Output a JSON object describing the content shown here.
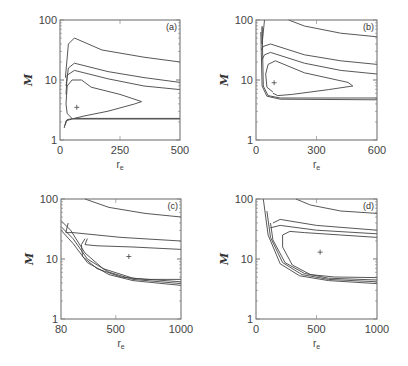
{
  "chart_data": [
    {
      "type": "contour",
      "panel": "(a)",
      "title": "",
      "xlabel": "r_e",
      "ylabel": "M",
      "xscale": "linear",
      "yscale": "log",
      "xlim": [
        0,
        500
      ],
      "ylim": [
        1,
        100
      ],
      "xticks": [
        "0",
        "250",
        "500"
      ],
      "yticks": [
        "1",
        "10",
        "100"
      ],
      "marker": {
        "symbol": "+",
        "x": 70,
        "y": 3.5
      },
      "box": {
        "left": 60,
        "top": 20,
        "right": 180,
        "bottom": 140
      },
      "contours": [
        [
          [
            0.1,
            0.82
          ],
          [
            0.06,
            0.78
          ],
          [
            0.05,
            0.7
          ],
          [
            0.06,
            0.55
          ],
          [
            0.1,
            0.5
          ],
          [
            0.18,
            0.5
          ],
          [
            0.26,
            0.56
          ],
          [
            0.5,
            0.62
          ],
          [
            0.68,
            0.68
          ],
          [
            0.62,
            0.7
          ],
          [
            0.4,
            0.76
          ],
          [
            0.2,
            0.8
          ],
          [
            0.12,
            0.82
          ]
        ],
        [
          [
            0.04,
            0.88
          ],
          [
            0.06,
            0.83
          ],
          [
            0.12,
            0.82
          ],
          [
            1.0,
            0.82
          ]
        ],
        [
          [
            0.035,
            0.9
          ],
          [
            0.05,
            0.84
          ],
          [
            0.1,
            0.825
          ],
          [
            1.0,
            0.825
          ]
        ],
        [
          [
            0.05,
            0.62
          ],
          [
            0.06,
            0.46
          ],
          [
            0.12,
            0.42
          ],
          [
            0.4,
            0.49
          ],
          [
            0.7,
            0.55
          ],
          [
            1.0,
            0.58
          ]
        ],
        [
          [
            0.05,
            0.55
          ],
          [
            0.07,
            0.4
          ],
          [
            0.12,
            0.36
          ],
          [
            0.4,
            0.43
          ],
          [
            0.7,
            0.48
          ],
          [
            1.0,
            0.52
          ]
        ],
        [
          [
            0.045,
            0.48
          ],
          [
            0.07,
            0.2
          ],
          [
            0.12,
            0.15
          ],
          [
            0.35,
            0.25
          ],
          [
            0.7,
            0.31
          ],
          [
            1.0,
            0.35
          ]
        ]
      ]
    },
    {
      "type": "contour",
      "panel": "(b)",
      "xlabel": "r_e",
      "ylabel": "M",
      "xscale": "linear",
      "yscale": "log",
      "xlim": [
        0,
        600
      ],
      "ylim": [
        1,
        100
      ],
      "xticks": [
        "0",
        "300",
        "600"
      ],
      "yticks": [
        "1",
        "10",
        "100"
      ],
      "marker": {
        "symbol": "+",
        "x": 90,
        "y": 9
      },
      "box": {
        "left": 256,
        "top": 20,
        "right": 377,
        "bottom": 140
      },
      "contours": [
        [
          [
            0.14,
            0.6
          ],
          [
            0.09,
            0.56
          ],
          [
            0.08,
            0.45
          ],
          [
            0.1,
            0.37
          ],
          [
            0.16,
            0.34
          ],
          [
            0.4,
            0.44
          ],
          [
            0.76,
            0.52
          ],
          [
            0.8,
            0.55
          ],
          [
            0.6,
            0.58
          ],
          [
            0.3,
            0.62
          ],
          [
            0.18,
            0.63
          ],
          [
            0.14,
            0.61
          ]
        ],
        [
          [
            0.05,
            0.06
          ],
          [
            0.06,
            0.55
          ],
          [
            0.1,
            0.63
          ],
          [
            0.2,
            0.65
          ],
          [
            1.0,
            0.65
          ]
        ],
        [
          [
            0.04,
            0.1
          ],
          [
            0.05,
            0.55
          ],
          [
            0.09,
            0.635
          ],
          [
            0.2,
            0.66
          ],
          [
            1.0,
            0.665
          ]
        ],
        [
          [
            0.045,
            0.25
          ],
          [
            0.06,
            0.22
          ],
          [
            0.12,
            0.2
          ],
          [
            0.4,
            0.29
          ],
          [
            0.7,
            0.34
          ],
          [
            1.0,
            0.37
          ]
        ],
        [
          [
            0.05,
            0.33
          ],
          [
            0.07,
            0.29
          ],
          [
            0.12,
            0.27
          ],
          [
            0.4,
            0.36
          ],
          [
            0.7,
            0.42
          ],
          [
            1.0,
            0.45
          ]
        ],
        [
          [
            0.07,
            0.0
          ],
          [
            0.05,
            0.2
          ],
          [
            0.05,
            0.05
          ]
        ],
        [
          [
            0.27,
            0.0
          ],
          [
            0.4,
            0.05
          ],
          [
            0.7,
            0.11
          ],
          [
            1.0,
            0.14
          ]
        ]
      ]
    },
    {
      "type": "contour",
      "panel": "(c)",
      "xlabel": "r_e",
      "ylabel": "M",
      "xscale": "linear",
      "yscale": "log",
      "xlim": [
        80,
        1000
      ],
      "ylim": [
        1,
        100
      ],
      "xticks": [
        "80",
        "500",
        "1000"
      ],
      "yticks": [
        "1",
        "10",
        "100"
      ],
      "marker": {
        "symbol": "+",
        "x": 600,
        "y": 11
      },
      "box": {
        "left": 61,
        "top": 199,
        "right": 181,
        "bottom": 319
      },
      "contours": [
        [
          [
            0.2,
            0.33
          ],
          [
            0.17,
            0.38
          ],
          [
            0.18,
            0.48
          ],
          [
            0.3,
            0.58
          ],
          [
            0.5,
            0.65
          ],
          [
            0.7,
            0.67
          ],
          [
            1.0,
            0.67
          ]
        ],
        [
          [
            0.0,
            0.18
          ],
          [
            0.08,
            0.26
          ],
          [
            0.2,
            0.45
          ],
          [
            0.35,
            0.58
          ],
          [
            0.6,
            0.66
          ],
          [
            1.0,
            0.69
          ]
        ],
        [
          [
            0.0,
            0.23
          ],
          [
            0.1,
            0.33
          ],
          [
            0.22,
            0.5
          ],
          [
            0.4,
            0.61
          ],
          [
            0.6,
            0.67
          ],
          [
            1.0,
            0.705
          ]
        ],
        [
          [
            0.0,
            0.26
          ],
          [
            0.1,
            0.37
          ],
          [
            0.22,
            0.53
          ],
          [
            0.4,
            0.63
          ],
          [
            0.6,
            0.68
          ],
          [
            1.0,
            0.72
          ]
        ],
        [
          [
            0.22,
            0.33
          ],
          [
            0.2,
            0.38
          ],
          [
            0.3,
            0.39
          ],
          [
            0.6,
            0.4
          ],
          [
            1.0,
            0.42
          ]
        ],
        [
          [
            0.06,
            0.2
          ],
          [
            0.04,
            0.28
          ],
          [
            0.1,
            0.28
          ],
          [
            0.5,
            0.32
          ],
          [
            1.0,
            0.35
          ]
        ],
        [
          [
            0.2,
            0.0
          ],
          [
            0.4,
            0.07
          ],
          [
            0.7,
            0.12
          ],
          [
            1.0,
            0.15
          ]
        ]
      ]
    },
    {
      "type": "contour",
      "panel": "(d)",
      "xlabel": "r_e",
      "ylabel": "M",
      "xscale": "linear",
      "yscale": "log",
      "xlim": [
        0,
        1000
      ],
      "ylim": [
        1,
        100
      ],
      "xticks": [
        "0",
        "500",
        "1000"
      ],
      "yticks": [
        "1",
        "10",
        "100"
      ],
      "marker": {
        "symbol": "+",
        "x": 530,
        "y": 13
      },
      "box": {
        "left": 256,
        "top": 199,
        "right": 377,
        "bottom": 319
      },
      "contours": [
        [
          [
            0.28,
            0.27
          ],
          [
            0.22,
            0.3
          ],
          [
            0.22,
            0.4
          ],
          [
            0.3,
            0.55
          ],
          [
            0.45,
            0.63
          ],
          [
            0.65,
            0.65
          ],
          [
            1.0,
            0.655
          ]
        ],
        [
          [
            0.12,
            0.2
          ],
          [
            0.14,
            0.34
          ],
          [
            0.24,
            0.53
          ],
          [
            0.4,
            0.62
          ],
          [
            0.6,
            0.66
          ],
          [
            1.0,
            0.675
          ]
        ],
        [
          [
            0.09,
            0.1
          ],
          [
            0.12,
            0.32
          ],
          [
            0.22,
            0.53
          ],
          [
            0.38,
            0.63
          ],
          [
            0.6,
            0.67
          ],
          [
            1.0,
            0.69
          ]
        ],
        [
          [
            0.06,
            0.0
          ],
          [
            0.1,
            0.3
          ],
          [
            0.2,
            0.54
          ],
          [
            0.36,
            0.64
          ],
          [
            0.6,
            0.68
          ],
          [
            1.0,
            0.705
          ]
        ],
        [
          [
            0.28,
            0.27
          ],
          [
            0.4,
            0.28
          ],
          [
            0.7,
            0.3
          ],
          [
            1.0,
            0.32
          ]
        ],
        [
          [
            0.14,
            0.2
          ],
          [
            0.2,
            0.17
          ],
          [
            0.5,
            0.22
          ],
          [
            1.0,
            0.26
          ]
        ],
        [
          [
            0.12,
            0.24
          ],
          [
            0.2,
            0.22
          ],
          [
            0.5,
            0.26
          ],
          [
            1.0,
            0.29
          ]
        ],
        [
          [
            0.33,
            0.0
          ],
          [
            0.45,
            0.05
          ],
          [
            0.7,
            0.1
          ],
          [
            1.0,
            0.12
          ]
        ]
      ]
    }
  ]
}
